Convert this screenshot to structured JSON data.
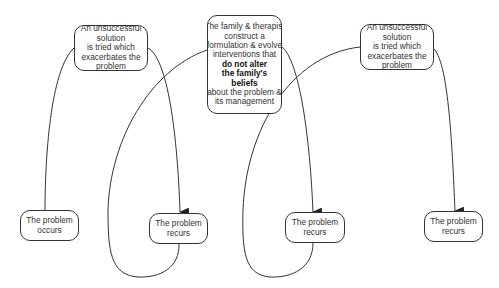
{
  "diagram": {
    "colors": {
      "stroke": "#333333",
      "text": "#333333",
      "background": "#ffffff"
    },
    "nodes": {
      "solution_left": {
        "lines": [
          "An unsuccessful",
          "solution",
          "is tried which",
          "exacerbates the",
          "problem"
        ]
      },
      "intervention": {
        "lines": [
          "The family & therapist",
          "construct a",
          "formulation & evolve",
          "interventions that"
        ],
        "bold_lines": [
          "do not alter",
          "the family's",
          "beliefs"
        ],
        "tail_lines": [
          "about the problem &",
          "its management"
        ]
      },
      "solution_right": {
        "lines": [
          "An unsuccessful",
          "solution",
          "is tried which",
          "exacerbates the",
          "problem"
        ]
      },
      "occurs": {
        "lines": [
          "The problem",
          "occurs"
        ]
      },
      "recurs_1": {
        "lines": [
          "The problem",
          "recurs"
        ]
      },
      "recurs_2": {
        "lines": [
          "The problem",
          "recurs"
        ]
      },
      "recurs_3": {
        "lines": [
          "The problem",
          "recurs"
        ]
      }
    },
    "edges": [
      {
        "from": "occurs",
        "to": "solution_left",
        "arrow": false
      },
      {
        "from": "solution_left",
        "to": "recurs_1",
        "arrow": true
      },
      {
        "from": "recurs_1",
        "to": "intervention",
        "arrow": false
      },
      {
        "from": "intervention",
        "to": "recurs_2",
        "arrow": true
      },
      {
        "from": "recurs_2",
        "to": "solution_right",
        "arrow": false
      },
      {
        "from": "solution_right",
        "to": "recurs_3",
        "arrow": true
      }
    ]
  }
}
